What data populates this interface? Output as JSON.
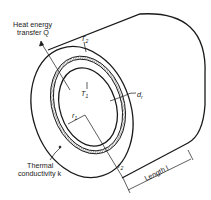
{
  "diagram": {
    "type": "thick-walled cylinder heat conduction",
    "labels": {
      "heat_line1": "Heat energy",
      "heat_line2": "transfer Q",
      "outer_temp": "T",
      "outer_temp_sub": "2",
      "inner_temp": "T",
      "inner_temp_sub": "1",
      "wall_element": "d",
      "wall_element_sub": "r",
      "inner_radius": "r",
      "inner_radius_sub": "1",
      "outer_radius": "r",
      "outer_radius_sub": "2",
      "conductivity_line1": "Thermal",
      "conductivity_line2": "conductivity k",
      "length": "Length l"
    },
    "colors": {
      "stroke": "#1a1a1a",
      "background": "#ffffff"
    }
  }
}
